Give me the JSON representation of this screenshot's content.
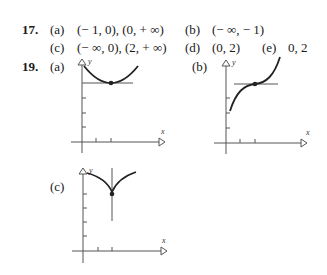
{
  "problems": [
    {
      "number": "17.",
      "parts": [
        {
          "label": "(a)",
          "answer": "(− 1, 0), (0, + ∞)"
        },
        {
          "label": "(b)",
          "answer": "(− ∞, − 1)"
        },
        {
          "label": "(c)",
          "answer": "(− ∞, 0), (2, + ∞)"
        },
        {
          "label": "(d)",
          "answer": "(0, 2)"
        },
        {
          "label": "(e)",
          "answer": "0, 2"
        }
      ]
    },
    {
      "number": "19.",
      "parts": [
        {
          "label": "(a)",
          "graph": "parabola-like curve with minimum point on horizontal tangent line",
          "axis_x": "x",
          "axis_y": "y"
        },
        {
          "label": "(b)",
          "graph": "increasing curve with inflection point on horizontal tangent line",
          "axis_x": "x",
          "axis_y": "y"
        },
        {
          "label": "(c)",
          "graph": "cusp at point with vertical tangent line",
          "axis_x": "x",
          "axis_y": "y"
        }
      ]
    }
  ]
}
